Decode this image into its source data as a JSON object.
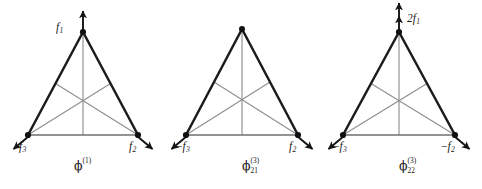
{
  "figure": {
    "kind": "normal-mode-vibration-diagrams",
    "panel_count": 3,
    "colors": {
      "outline": "#1c1c1c",
      "median": "#8d8d8d",
      "baseline": "#6f6f6f",
      "vertex_dot": "#111111",
      "arrow": "#141414",
      "text": "#1b1b1b",
      "background": "#ffffff"
    }
  },
  "panels": [
    {
      "id": "panel-1",
      "caption": {
        "symbol": "ϕ",
        "sub": "",
        "sup": "(1)",
        "text": "ϕ(1)"
      },
      "apex": {
        "label": "f1",
        "label_base": "f",
        "label_sub": "1",
        "coefficient": "",
        "sign": "",
        "arrow": "up",
        "arrow_heads": 1,
        "has_arrow": true
      },
      "left": {
        "label": "f3",
        "label_base": "f",
        "label_sub": "3",
        "coefficient": "",
        "sign": "",
        "arrow": "down-left",
        "arrow_heads": 1,
        "has_arrow": true
      },
      "right": {
        "label": "f2",
        "label_base": "f",
        "label_sub": "2",
        "coefficient": "",
        "sign": "",
        "arrow": "down-right",
        "arrow_heads": 1,
        "has_arrow": true
      }
    },
    {
      "id": "panel-2",
      "caption": {
        "symbol": "ϕ",
        "sub": "21",
        "sup": "(3)",
        "text": "ϕ21(3)"
      },
      "apex": {
        "label": "",
        "label_base": "",
        "label_sub": "",
        "coefficient": "",
        "sign": "",
        "arrow": "none",
        "arrow_heads": 0,
        "has_arrow": false
      },
      "left": {
        "label": "-f3",
        "label_base": "f",
        "label_sub": "3",
        "coefficient": "",
        "sign": "−",
        "arrow": "down-left",
        "arrow_heads": 1,
        "has_arrow": true
      },
      "right": {
        "label": "f2",
        "label_base": "f",
        "label_sub": "2",
        "coefficient": "",
        "sign": "",
        "arrow": "down-right",
        "arrow_heads": 1,
        "has_arrow": true
      }
    },
    {
      "id": "panel-3",
      "caption": {
        "symbol": "ϕ",
        "sub": "22",
        "sup": "(3)",
        "text": "ϕ22(3)"
      },
      "apex": {
        "label": "2f1",
        "label_base": "f",
        "label_sub": "1",
        "coefficient": "2",
        "sign": "",
        "arrow": "up",
        "arrow_heads": 2,
        "has_arrow": true
      },
      "left": {
        "label": "-f3",
        "label_base": "f",
        "label_sub": "3",
        "coefficient": "",
        "sign": "−",
        "arrow": "down-left",
        "arrow_heads": 1,
        "has_arrow": true
      },
      "right": {
        "label": "-f2",
        "label_base": "f",
        "label_sub": "2",
        "coefficient": "",
        "sign": "−",
        "arrow": "down-right",
        "arrow_heads": 1,
        "has_arrow": true
      }
    }
  ]
}
